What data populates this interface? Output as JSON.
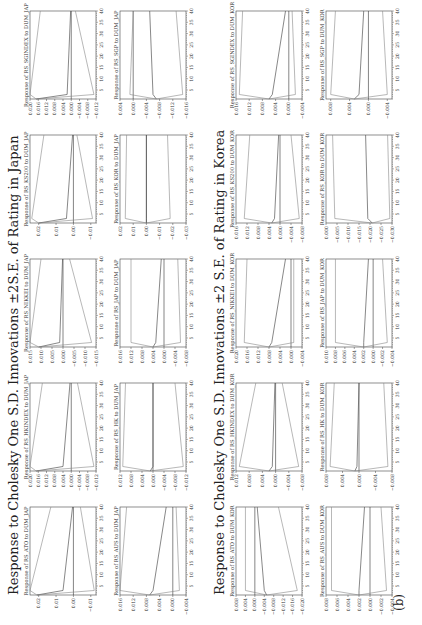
{
  "caption": "(b)",
  "sections": [
    {
      "key": "japan",
      "title": "Response to Cholesky One S.D. Innovations ±2S.E. of Rating in Japan",
      "panels": [
        {
          "title": "Response of RS_ATO to DUM_JAP",
          "yticks": [
            "0.02",
            "0.01",
            "0.00",
            "−0.01"
          ],
          "ylim": [
            -0.013,
            0.025
          ],
          "center": [
            0.021,
            0.006,
            0.0005
          ],
          "upper": [
            0.025,
            0.013
          ],
          "lower": [
            -0.012,
            -0.004
          ]
        },
        {
          "title": "Response of RS_HKINDEX to DUM_JAP",
          "yticks": [
            "0.020",
            "0.016",
            "0.012",
            "0.008",
            "0.004",
            "0.000",
            "−0.004",
            "−0.008",
            "−0.012"
          ],
          "ylim": [
            -0.012,
            0.02
          ],
          "center": [
            0.017,
            0.004,
            0.0006
          ],
          "upper": [
            0.02,
            0.014
          ],
          "lower": [
            -0.011,
            -0.003
          ]
        },
        {
          "title": "Response of RS_NIKKEI to DUM_JAP",
          "yticks": [
            "0.015",
            "0.010",
            "0.005",
            "0.000",
            "−0.005",
            "−0.010",
            "−0.015"
          ],
          "ylim": [
            -0.015,
            0.015
          ],
          "center": [
            0.011,
            0.0015,
            0.0002
          ],
          "upper": [
            0.015,
            0.01
          ],
          "lower": [
            -0.013,
            -0.003
          ]
        },
        {
          "title": "Response of RS_KS200 to DUM_JAP",
          "yticks": [
            "0.02",
            "0.01",
            "0.00",
            "−0.01"
          ],
          "ylim": [
            -0.013,
            0.025
          ],
          "center": [
            0.02,
            0.004,
            0.0005
          ],
          "upper": [
            0.024,
            0.017
          ],
          "lower": [
            -0.011,
            -0.002
          ]
        },
        {
          "title": "Response of RS_SGINDEX to DUM_JAP",
          "yticks": [
            "0.020",
            "0.016",
            "0.012",
            "0.008",
            "0.004",
            "0.000",
            "−0.004",
            "−0.008",
            "−0.012"
          ],
          "ylim": [
            -0.012,
            0.02
          ],
          "center": [
            0.017,
            0.002,
            0.0003
          ],
          "upper": [
            0.02,
            0.015
          ],
          "lower": [
            -0.011,
            -0.002
          ]
        },
        {
          "title": "Response of RS_AUS to DUM_JAP",
          "yticks": [
            "0.016",
            "0.012",
            "0.008",
            "0.004",
            "0.000",
            "−0.004"
          ],
          "ylim": [
            -0.004,
            0.016
          ],
          "center": [
            0.007,
            0.006,
            0.002
          ],
          "upper": [
            0.016,
            0.014
          ],
          "lower": [
            -0.002,
            -0.001
          ]
        },
        {
          "title": "Response of RS_HK to DUM_JAP",
          "yticks": [
            "0.012",
            "0.008",
            "0.004",
            "0.000",
            "−0.004",
            "−0.008",
            "−0.012"
          ],
          "ylim": [
            -0.012,
            0.012
          ],
          "center": [
            0.001,
            0.0,
            0.0
          ],
          "upper": [
            0.011,
            0.01
          ],
          "lower": [
            -0.011,
            -0.008
          ]
        },
        {
          "title": "Response of RS_JAP to DUM_JAP",
          "yticks": [
            "0.016",
            "0.012",
            "0.008",
            "0.004",
            "0.000",
            "−0.004",
            "−0.008"
          ],
          "ylim": [
            -0.008,
            0.016
          ],
          "center": [
            0.004,
            0.003,
            0.001
          ],
          "upper": [
            0.012,
            0.012
          ],
          "lower": [
            -0.006,
            -0.005
          ]
        },
        {
          "title": "Response of RS_KOR to DUM_JAP",
          "yticks": [
            "0.02",
            "0.01",
            "0.00",
            "−0.01",
            "−0.02",
            "−0.03"
          ],
          "ylim": [
            -0.03,
            0.02
          ],
          "center": [
            0.0,
            0.0,
            0.0
          ],
          "upper": [
            0.016,
            0.015
          ],
          "lower": [
            -0.018,
            -0.016
          ]
        },
        {
          "title": "Response of RS_SGP to DUM_JAP",
          "yticks": [
            "0.004",
            "0.000",
            "−0.004",
            "−0.008",
            "−0.012",
            "−0.016"
          ],
          "ylim": [
            -0.016,
            0.004
          ],
          "center": [
            -0.007,
            -0.006,
            -0.005
          ],
          "upper": [
            0.001,
            0.0
          ],
          "lower": [
            -0.015,
            -0.013
          ]
        }
      ]
    },
    {
      "key": "korea",
      "title": "Response to Cholesky One S.D. Innovations ±2 S.E. of Rating in Korea",
      "panels": [
        {
          "title": "Response of RS_ATO to DUM_KOR",
          "yticks": [
            "0.008",
            "0.004",
            "0.000",
            "−0.004",
            "−0.008",
            "−0.012",
            "−0.016",
            "−0.020"
          ],
          "ylim": [
            -0.02,
            0.008
          ],
          "center": [
            -0.005,
            -0.004,
            -0.001
          ],
          "upper": [
            0.004,
            0.004
          ],
          "lower": [
            -0.018,
            -0.01
          ]
        },
        {
          "title": "Response of RS_HKINDEX to DUM_KOR",
          "yticks": [
            "0.012",
            "0.008",
            "0.004",
            "0.000",
            "−0.004",
            "−0.008"
          ],
          "ylim": [
            -0.008,
            0.012
          ],
          "center": [
            0.002,
            0.001,
            0.0002
          ],
          "upper": [
            0.011,
            0.006
          ],
          "lower": [
            -0.007,
            -0.002
          ]
        },
        {
          "title": "Response of RS_NIKKEI to DUM_KOR",
          "yticks": [
            "0.020",
            "0.016",
            "0.012",
            "0.008",
            "0.004",
            "0.000",
            "−0.004"
          ],
          "ylim": [
            -0.004,
            0.02
          ],
          "center": [
            0.008,
            0.007,
            0.002
          ],
          "upper": [
            0.017,
            0.016
          ],
          "lower": [
            -0.001,
            -0.001
          ]
        },
        {
          "title": "Response of RS_KS200 to DUM_KOR",
          "yticks": [
            "0.016",
            "0.012",
            "0.008",
            "0.004",
            "0.000",
            "−0.004",
            "−0.008"
          ],
          "ylim": [
            -0.008,
            0.016
          ],
          "center": [
            0.003,
            0.002,
            0.0005
          ],
          "upper": [
            0.013,
            0.011
          ],
          "lower": [
            -0.007,
            -0.004
          ]
        },
        {
          "title": "Response of RS_SGINDEX to DUM_KOR",
          "yticks": [
            "0.016",
            "0.012",
            "0.008",
            "0.004",
            "0.000",
            "−0.004"
          ],
          "ylim": [
            -0.004,
            0.016
          ],
          "center": [
            0.006,
            0.005,
            0.001
          ],
          "upper": [
            0.015,
            0.014
          ],
          "lower": [
            -0.002,
            -0.001
          ]
        },
        {
          "title": "Response of RS_AUS to DUM_KOR",
          "yticks": [
            "0.008",
            "0.006",
            "0.004",
            "0.002",
            "0.000",
            "−0.002",
            "−0.004"
          ],
          "ylim": [
            -0.004,
            0.008
          ],
          "center": [
            0.002,
            0.002,
            0.001
          ],
          "upper": [
            0.007,
            0.007
          ],
          "lower": [
            -0.003,
            -0.002
          ]
        },
        {
          "title": "Response of RS_HK to DUM_KOR",
          "yticks": [
            "0.008",
            "0.004",
            "0.000",
            "−0.004",
            "−0.008"
          ],
          "ylim": [
            -0.008,
            0.008
          ],
          "center": [
            0.001,
            0.0005,
            0.0
          ],
          "upper": [
            0.007,
            0.006
          ],
          "lower": [
            -0.007,
            -0.006
          ]
        },
        {
          "title": "Response of RS_JAP to DUM_KOR",
          "yticks": [
            "0.010",
            "0.008",
            "0.006",
            "0.004",
            "0.002",
            "0.000",
            "−0.002",
            "−0.004"
          ],
          "ylim": [
            -0.004,
            0.01
          ],
          "center": [
            0.002,
            0.002,
            0.001
          ],
          "upper": [
            0.008,
            0.008
          ],
          "lower": [
            -0.003,
            -0.002
          ]
        },
        {
          "title": "Response of RS_KOR to DUM_KOR",
          "yticks": [
            "0.000",
            "−0.005",
            "−0.010",
            "−0.015",
            "−0.020",
            "−0.025",
            "−0.030"
          ],
          "ylim": [
            -0.03,
            0.0
          ],
          "center": [
            -0.021,
            -0.019,
            -0.018
          ],
          "upper": [
            -0.004,
            -0.003
          ],
          "lower": [
            -0.029,
            -0.028
          ]
        },
        {
          "title": "Response of RS_SGP to DUM_KOR",
          "yticks": [
            "0.008",
            "0.004",
            "0.000",
            "−0.004"
          ],
          "ylim": [
            -0.005,
            0.009
          ],
          "center": [
            0.003,
            0.002,
            0.001
          ],
          "upper": [
            0.008,
            0.007
          ],
          "lower": [
            -0.004,
            -0.003
          ]
        }
      ]
    }
  ],
  "chart_data": {
    "type": "line",
    "x": {
      "label": "",
      "ticks": [
        5,
        10,
        15,
        20,
        25,
        30,
        35,
        40
      ],
      "range": [
        1,
        40
      ]
    },
    "panels_ref": "sections[].panels[]"
  }
}
